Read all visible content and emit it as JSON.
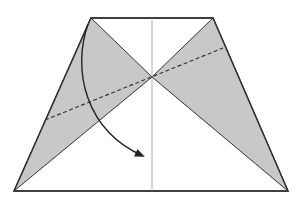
{
  "diagram": {
    "type": "origami-fold-step",
    "colors": {
      "background": "#ffffff",
      "paper_outline": "#333333",
      "shaded_flap": "#c8c8c8",
      "center_crease": "#9a9a9a",
      "valley_fold": "#333333",
      "arrow": "#222222"
    },
    "shape": {
      "name": "trapezoid",
      "vertices": [
        [
          91,
          18
        ],
        [
          213,
          18
        ],
        [
          288,
          191
        ],
        [
          14,
          191
        ]
      ]
    },
    "center_crease": {
      "x": 152,
      "y1": 18,
      "y2": 191
    },
    "intersection": [
      152,
      77
    ],
    "shaded_regions": [
      {
        "name": "left-flap",
        "points": [
          [
            91,
            18
          ],
          [
            152,
            77
          ],
          [
            14,
            191
          ]
        ]
      },
      {
        "name": "right-flap",
        "points": [
          [
            213,
            18
          ],
          [
            152,
            77
          ],
          [
            288,
            191
          ]
        ]
      }
    ],
    "valley_fold_line": {
      "from": [
        45,
        120
      ],
      "to": [
        223,
        48
      ],
      "style": "dashed"
    },
    "fold_arrow": {
      "from": [
        88,
        24
      ],
      "to": [
        143,
        156
      ],
      "direction": "down-right"
    }
  }
}
